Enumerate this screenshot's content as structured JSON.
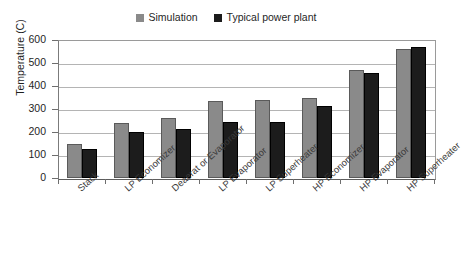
{
  "chart_data": {
    "type": "bar",
    "title": "",
    "xlabel": "",
    "ylabel": "Temperature (C)",
    "ylim": [
      0,
      600
    ],
    "ytick_step": 100,
    "yticks": [
      0,
      100,
      200,
      300,
      400,
      500,
      600
    ],
    "grid": true,
    "legend_position": "top-center",
    "categories": [
      "Stack",
      "LP Economizer",
      "Deaerat or Evaporator",
      "LP Evaporator",
      "LP Superheater",
      "HP Economizer",
      "HP Evaporator",
      "HP Superheater"
    ],
    "series": [
      {
        "name": "Simulation",
        "color": "#8a8a8a",
        "values": [
          150,
          240,
          262,
          335,
          338,
          350,
          470,
          560
        ]
      },
      {
        "name": "Typical power plant",
        "color": "#1c1c1c",
        "values": [
          128,
          200,
          215,
          245,
          243,
          315,
          455,
          570
        ]
      }
    ]
  },
  "legend": {
    "entries": [
      {
        "label": "Simulation",
        "swatch": "legend-swatch-simulation"
      },
      {
        "label": "Typical power plant",
        "swatch": "legend-swatch-typical-power-plant"
      }
    ]
  },
  "colors": {
    "simulation": "#8a8a8a",
    "typical_power_plant": "#1c1c1c",
    "gridline": "#b4b4b4",
    "axis": "#5d5d5d",
    "text": "#1f1f1f"
  }
}
